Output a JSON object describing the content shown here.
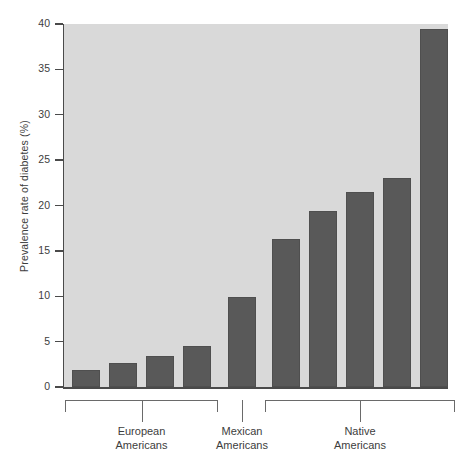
{
  "chart_data": {
    "type": "bar",
    "title": "",
    "subtitle": "",
    "xlabel": "",
    "ylabel": "Prevalence rate of diabetes (%)",
    "ylim": [
      0,
      40
    ],
    "ytick_labels": [
      "0",
      "5",
      "10",
      "15",
      "20",
      "25",
      "30",
      "35",
      "40"
    ],
    "ytick_values": [
      0,
      5,
      10,
      15,
      20,
      25,
      30,
      35,
      40
    ],
    "grid": false,
    "legend": "none",
    "bar_color": "#595959",
    "plot_background": "#d9d9d9",
    "axis_color": "#4a4a4a",
    "categories": [
      "1",
      "2",
      "3",
      "4",
      "5",
      "6",
      "7",
      "8",
      "9",
      "10"
    ],
    "values": [
      1.9,
      2.7,
      3.4,
      4.5,
      9.9,
      16.3,
      19.4,
      21.5,
      23.0,
      39.4
    ],
    "groups": [
      {
        "label_line1": "European",
        "label_line2": "Americans",
        "bars": [
          0,
          1,
          2,
          3
        ],
        "type": "bracket"
      },
      {
        "label_line1": "Mexican",
        "label_line2": "Americans",
        "bars": [
          4
        ],
        "type": "tick"
      },
      {
        "label_line1": "Native",
        "label_line2": "Americans",
        "bars": [
          5,
          6,
          7,
          8,
          9
        ],
        "type": "bracket"
      }
    ]
  }
}
